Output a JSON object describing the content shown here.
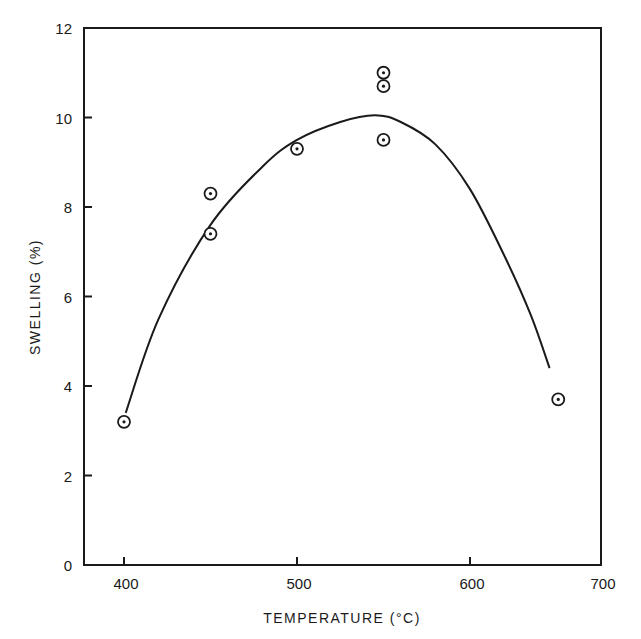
{
  "chart_data": {
    "type": "scatter",
    "title": "",
    "xlabel": "TEMPERATURE (°C)",
    "ylabel": "SWELLING (%)",
    "xlim": [
      377,
      676
    ],
    "ylim": [
      0,
      12
    ],
    "x_ticks": [
      400,
      500,
      600,
      700
    ],
    "y_ticks": [
      0,
      2,
      4,
      6,
      8,
      10,
      12
    ],
    "grid": false,
    "legend": null,
    "series": [
      {
        "name": "data points",
        "marker": "circled-dot",
        "points": [
          {
            "x": 400,
            "y": 3.2
          },
          {
            "x": 450,
            "y": 8.3
          },
          {
            "x": 450,
            "y": 7.4
          },
          {
            "x": 500,
            "y": 9.3
          },
          {
            "x": 550,
            "y": 11.0
          },
          {
            "x": 550,
            "y": 10.7
          },
          {
            "x": 550,
            "y": 9.5
          },
          {
            "x": 651,
            "y": 3.7
          }
        ]
      },
      {
        "name": "fitted curve",
        "type": "line",
        "points": [
          {
            "x": 401,
            "y": 3.4
          },
          {
            "x": 420,
            "y": 5.5
          },
          {
            "x": 450,
            "y": 7.6
          },
          {
            "x": 480,
            "y": 8.9
          },
          {
            "x": 500,
            "y": 9.5
          },
          {
            "x": 525,
            "y": 9.9
          },
          {
            "x": 545,
            "y": 10.05
          },
          {
            "x": 560,
            "y": 9.9
          },
          {
            "x": 580,
            "y": 9.4
          },
          {
            "x": 600,
            "y": 8.4
          },
          {
            "x": 620,
            "y": 6.9
          },
          {
            "x": 635,
            "y": 5.6
          },
          {
            "x": 646,
            "y": 4.4
          }
        ]
      }
    ]
  },
  "axes": {
    "x": {
      "title": "TEMPERATURE (°C)",
      "ticks": [
        "400",
        "500",
        "600",
        "700"
      ]
    },
    "y": {
      "title": "SWELLING (%)",
      "ticks": [
        "0",
        "2",
        "4",
        "6",
        "8",
        "10",
        "12"
      ]
    }
  }
}
